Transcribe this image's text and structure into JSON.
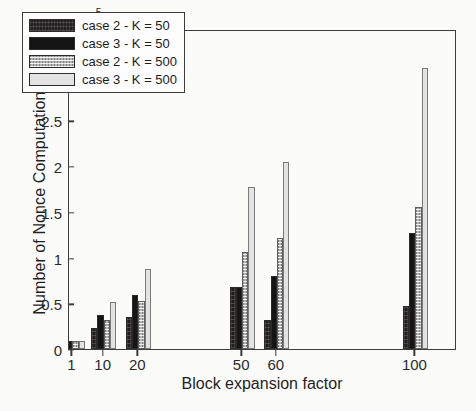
{
  "chart_data": {
    "type": "bar",
    "title": "",
    "xlabel": "Block expansion factor",
    "ylabel": "Number of Nonce Computations",
    "y_exponent_label": "×10",
    "y_exponent_power": "5",
    "y_scale_factor": 100000,
    "ylim": [
      0,
      3.5
    ],
    "yticks": [
      "0",
      "0.5",
      "1",
      "1.5",
      "2",
      "2.5",
      "3",
      "3.5"
    ],
    "ytick_values": [
      0,
      0.5,
      1,
      1.5,
      2,
      2.5,
      3,
      3.5
    ],
    "xticks": [
      "1",
      "10",
      "20",
      "50",
      "60",
      "100"
    ],
    "categories": [
      1,
      10,
      20,
      50,
      60,
      100
    ],
    "grid": false,
    "legend_position": "upper left",
    "series": [
      {
        "name": "case 2 - K = 50",
        "swatch": "dark-hatched",
        "color": "#231f20",
        "values": [
          0.09,
          0.23,
          0.35,
          0.68,
          0.32,
          0.47
        ]
      },
      {
        "name": "case 3 - K = 50",
        "swatch": "solid-black",
        "color": "#151515",
        "values": [
          0.09,
          0.37,
          0.59,
          0.68,
          0.8,
          1.27
        ]
      },
      {
        "name": "case 2 - K = 500",
        "swatch": "gray-dotted",
        "color": "#b4b4b4",
        "values": [
          0.09,
          0.32,
          0.52,
          1.06,
          1.21,
          1.55
        ]
      },
      {
        "name": "case 3 - K = 500",
        "swatch": "light-gray",
        "color": "#e3e3e3",
        "values": [
          0.09,
          0.51,
          0.88,
          1.77,
          2.05,
          3.07
        ]
      }
    ]
  },
  "legend": {
    "entries": [
      {
        "label": "case 2 - K = 50"
      },
      {
        "label": "case 3 - K = 50"
      },
      {
        "label": "case 2 - K = 500"
      },
      {
        "label": "case 3 - K = 500"
      }
    ]
  },
  "caption_fragment": ""
}
